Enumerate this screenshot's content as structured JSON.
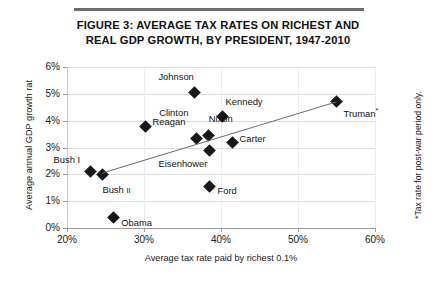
{
  "figure": {
    "title_line_1": "FIGURE 3: AVERAGE TAX RATES ON RICHEST AND",
    "title_line_2": "REAL GDP GROWTH, BY PRESIDENT, 1947-2010",
    "footnote": "*Tax rate for post-war period only."
  },
  "chart_data": {
    "type": "scatter",
    "title": "FIGURE 3: AVERAGE TAX RATES ON RICHEST AND REAL GDP GROWTH, BY PRESIDENT, 1947-2010",
    "xlabel": "Average tax rate paid by richest 0.1%",
    "ylabel": "Average annual GDP growth rat",
    "xlim": [
      20,
      60
    ],
    "ylim": [
      0,
      6
    ],
    "xticks": [
      "20%",
      "30%",
      "40%",
      "50%",
      "60%"
    ],
    "xtick_values": [
      20,
      30,
      40,
      50,
      60
    ],
    "yticks": [
      "0%",
      "1%",
      "2%",
      "3%",
      "4%",
      "5%",
      "6%"
    ],
    "ytick_values": [
      0,
      1,
      2,
      3,
      4,
      5,
      6
    ],
    "grid": true,
    "legend": "none",
    "marker_color": "#17171c",
    "trendline": {
      "show": true,
      "x0": 24.6,
      "y0": 2.05,
      "x1": 55.0,
      "y1": 4.7,
      "color": "#6b6b6b"
    },
    "points": [
      {
        "name": "Johnson",
        "label": "Johnson",
        "x": 36.6,
        "y": 5.05,
        "label_dx": -1,
        "label_dy": -16
      },
      {
        "name": "Kennedy",
        "label": "Kennedy",
        "x": 40.2,
        "y": 4.15,
        "label_dx": 3,
        "label_dy": -16
      },
      {
        "name": "Clinton",
        "label": "Clinton",
        "x": 36.8,
        "y": 3.35,
        "label_dx": -8,
        "label_dy": -26
      },
      {
        "name": "Reagan",
        "label": "Reagan",
        "x": 30.2,
        "y": 3.8,
        "label_dx": 7,
        "label_dy": -5
      },
      {
        "name": "Nixon",
        "label": "Nixon",
        "x": 38.4,
        "y": 3.45,
        "label_dx": 0,
        "label_dy": -17
      },
      {
        "name": "Carter",
        "label": "Carter",
        "x": 41.5,
        "y": 3.2,
        "label_dx": 7,
        "label_dy": -4
      },
      {
        "name": "Eisenhower",
        "label": "Eisenhower",
        "x": 38.5,
        "y": 2.9,
        "label_dx": -2,
        "label_dy": 13
      },
      {
        "name": "Truman",
        "label": "Truman*",
        "x": 55.0,
        "y": 4.7,
        "label_dx": 7,
        "label_dy": 10
      },
      {
        "name": "Bush I",
        "label": "Bush I",
        "x": 23.0,
        "y": 2.1,
        "label_dx": -10,
        "label_dy": -13
      },
      {
        "name": "Bush II",
        "label": "Bush II",
        "x": 24.6,
        "y": 1.98,
        "label_dx": 0,
        "label_dy": 14
      },
      {
        "name": "Ford",
        "label": "Ford",
        "x": 38.5,
        "y": 1.55,
        "label_dx": 8,
        "label_dy": 4
      },
      {
        "name": "Obama",
        "label": "Obama",
        "x": 26.0,
        "y": 0.38,
        "label_dx": 8,
        "label_dy": 4
      }
    ]
  }
}
